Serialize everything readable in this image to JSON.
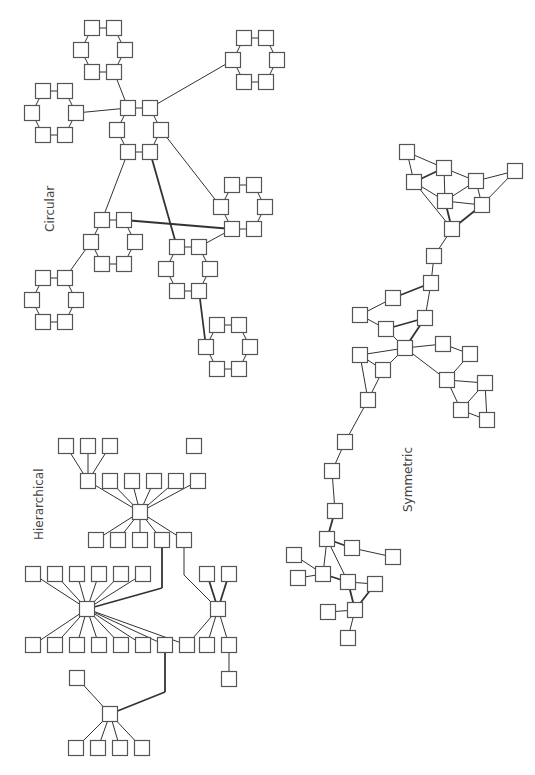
{
  "labels": {
    "circular": "Circular",
    "hierarchical": "Hierarchical",
    "symmetric": "Symmetric"
  },
  "colors": {
    "background": "#ffffff",
    "node_stroke": "#555555",
    "edge": "#333333",
    "label": "#444444"
  },
  "graphs": {
    "circular": {
      "name": "Circular",
      "layout": "circular",
      "clusters": 8,
      "nodes_per_cluster": 6
    },
    "hierarchical": {
      "name": "Hierarchical",
      "layout": "hierarchical"
    },
    "symmetric": {
      "name": "Symmetric",
      "layout": "symmetric"
    }
  }
}
